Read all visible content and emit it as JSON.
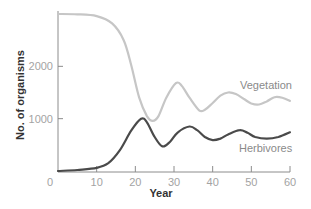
{
  "chart_data": {
    "type": "line",
    "title": "",
    "xlabel": "Year",
    "ylabel": "No. of organisms",
    "xlim": [
      0,
      60
    ],
    "ylim": [
      0,
      3000
    ],
    "xticks": [
      0,
      10,
      20,
      30,
      40,
      50,
      60
    ],
    "yticks": [
      1000,
      2000
    ],
    "grid": false,
    "legend_position": "inline labels at right",
    "series": [
      {
        "name": "Vegetation",
        "color": "#c6c6c6",
        "x": [
          0,
          5,
          10,
          14,
          17,
          19,
          21,
          23,
          24.5,
          26,
          28,
          30.5,
          32,
          34,
          36.5,
          38,
          40,
          42,
          44,
          46,
          48,
          50,
          52,
          54,
          56,
          58,
          60
        ],
        "values": [
          3000,
          2995,
          2960,
          2820,
          2500,
          2000,
          1400,
          1050,
          960,
          1050,
          1400,
          1680,
          1630,
          1400,
          1160,
          1170,
          1300,
          1440,
          1500,
          1470,
          1380,
          1290,
          1270,
          1330,
          1410,
          1400,
          1340
        ]
      },
      {
        "name": "Herbivores",
        "color": "#4a4a4a",
        "x": [
          0,
          5,
          10,
          13,
          16,
          19,
          21.5,
          23,
          25,
          27,
          29,
          31,
          34,
          36,
          38,
          40,
          42,
          44,
          47,
          49,
          51,
          54,
          57,
          60
        ],
        "values": [
          0,
          20,
          60,
          150,
          400,
          780,
          1000,
          930,
          650,
          470,
          560,
          740,
          850,
          780,
          650,
          590,
          620,
          700,
          780,
          730,
          650,
          620,
          650,
          740
        ]
      }
    ]
  },
  "labels": {
    "x_axis_title": "Year",
    "y_axis_title": "No. of organisms",
    "vegetation": "Vegetation",
    "herbivores": "Herbivores",
    "x_ticks": [
      "0",
      "10",
      "20",
      "30",
      "40",
      "50",
      "60"
    ],
    "y_ticks": [
      "1000",
      "2000"
    ]
  },
  "colors": {
    "axis": "#8c8c8c",
    "tick_label": "#a3a3a3",
    "vegetation": "#c6c6c6",
    "herbivores": "#4a4a4a"
  }
}
